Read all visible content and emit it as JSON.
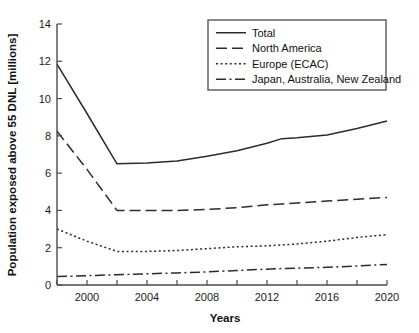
{
  "chart_data": {
    "type": "line",
    "title": "",
    "xlabel": "Years",
    "ylabel": "Population exposed above 55 DNL [millions]",
    "xlim": [
      1998,
      2020
    ],
    "ylim": [
      0,
      14
    ],
    "xticks": [
      2000,
      2004,
      2008,
      2012,
      2016,
      2020
    ],
    "xtick_labels": [
      "2000",
      "2004",
      "2008",
      "2012",
      "2016",
      "2020"
    ],
    "xminor_step": 2,
    "yticks": [
      0,
      2,
      4,
      6,
      8,
      10,
      12,
      14
    ],
    "ytick_labels": [
      "0",
      "2",
      "4",
      "6",
      "8",
      "10",
      "12",
      "14"
    ],
    "grid": false,
    "legend_position": "top-right",
    "x": [
      1998,
      2000,
      2002,
      2004,
      2006,
      2008,
      2010,
      2012,
      2013,
      2014,
      2016,
      2018,
      2020
    ],
    "series": [
      {
        "name": "Total",
        "dash": "solid",
        "values": [
          11.85,
          9.2,
          6.5,
          6.55,
          6.65,
          6.9,
          7.2,
          7.6,
          7.85,
          7.9,
          8.05,
          8.4,
          8.8
        ]
      },
      {
        "name": "North America",
        "dash": "long-dash",
        "values": [
          8.25,
          6.2,
          4.0,
          4.0,
          4.0,
          4.05,
          4.15,
          4.3,
          4.35,
          4.4,
          4.5,
          4.6,
          4.7
        ]
      },
      {
        "name": "Europe (ECAC)",
        "dash": "dotted",
        "values": [
          3.0,
          2.35,
          1.8,
          1.8,
          1.85,
          1.95,
          2.05,
          2.1,
          2.15,
          2.2,
          2.35,
          2.55,
          2.7
        ]
      },
      {
        "name": "Japan, Australia, New Zealand",
        "dash": "dash-dot",
        "values": [
          0.45,
          0.5,
          0.55,
          0.6,
          0.65,
          0.7,
          0.78,
          0.85,
          0.88,
          0.9,
          0.95,
          1.02,
          1.1
        ]
      }
    ]
  },
  "legend": {
    "entries": [
      {
        "label": "Total"
      },
      {
        "label": "North America"
      },
      {
        "label": "Europe (ECAC)"
      },
      {
        "label": "Japan, Australia, New Zealand"
      }
    ]
  },
  "colors": {
    "line": "#2b2b2b",
    "axis": "#4a4a4a",
    "text": "#111111",
    "background": "#ffffff"
  }
}
